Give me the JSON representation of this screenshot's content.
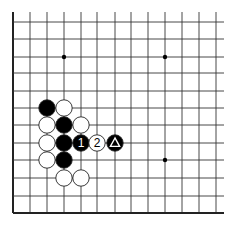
{
  "diagram": {
    "type": "go-board-fragment",
    "grid": {
      "columns": 13,
      "rows": 12,
      "x_lines": [
        13,
        30,
        47,
        64,
        81,
        97,
        115,
        131,
        148,
        165,
        182,
        199,
        216
      ],
      "y_lines": [
        22,
        39,
        57,
        73,
        91,
        108,
        125,
        143,
        160,
        178,
        196,
        213
      ],
      "edges": {
        "left": true,
        "bottom": true,
        "top": false,
        "right": false
      },
      "line_color": "#333333",
      "edge_color": "#222222"
    },
    "star_points": [
      {
        "col": 3,
        "row": 2
      },
      {
        "col": 9,
        "row": 2
      },
      {
        "col": 9,
        "row": 8
      }
    ],
    "stones": [
      {
        "col": 2,
        "row": 5,
        "color": "black"
      },
      {
        "col": 3,
        "row": 5,
        "color": "white"
      },
      {
        "col": 2,
        "row": 6,
        "color": "white"
      },
      {
        "col": 3,
        "row": 6,
        "color": "black"
      },
      {
        "col": 4,
        "row": 6,
        "color": "white"
      },
      {
        "col": 2,
        "row": 7,
        "color": "white"
      },
      {
        "col": 3,
        "row": 7,
        "color": "black"
      },
      {
        "col": 4,
        "row": 7,
        "color": "black",
        "label": "1"
      },
      {
        "col": 5,
        "row": 7,
        "color": "white",
        "label": "2"
      },
      {
        "col": 6,
        "row": 7,
        "color": "black",
        "marker": "triangle"
      },
      {
        "col": 2,
        "row": 8,
        "color": "white"
      },
      {
        "col": 3,
        "row": 8,
        "color": "black"
      },
      {
        "col": 3,
        "row": 9,
        "color": "white"
      },
      {
        "col": 4,
        "row": 9,
        "color": "white"
      }
    ],
    "colors": {
      "black_stone": "#000000",
      "white_stone": "#ffffff",
      "stone_outline": "#222222"
    }
  }
}
